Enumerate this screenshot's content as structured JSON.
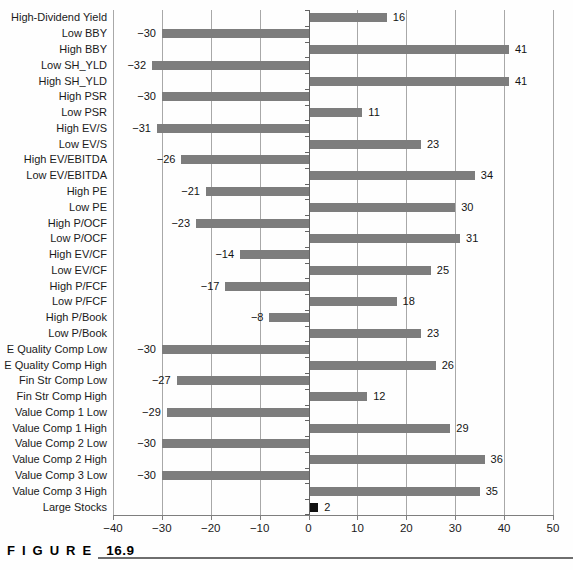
{
  "caption": {
    "figure_word": "FIGURE",
    "figure_number": "16.9"
  },
  "chart_data": {
    "type": "bar",
    "orientation": "horizontal",
    "title": "",
    "xlabel": "",
    "ylabel": "",
    "xlim": [
      -40,
      50
    ],
    "xticks": [
      -40,
      -30,
      -20,
      -10,
      0,
      10,
      20,
      30,
      40,
      50
    ],
    "grid": "vertical gridlines every 10 units",
    "legend": "none",
    "categories": [
      "High-Dividend Yield",
      "Low BBY",
      "High BBY",
      "Low SH_YLD",
      "High SH_YLD",
      "High PSR",
      "Low PSR",
      "High EV/S",
      "Low EV/S",
      "High EV/EBITDA",
      "Low EV/EBITDA",
      "High PE",
      "Low PE",
      "High P/OCF",
      "Low P/OCF",
      "High EV/CF",
      "Low EV/CF",
      "High P/FCF",
      "Low P/FCF",
      "High P/Book",
      "Low P/Book",
      "E Quality Comp Low",
      "E Quality Comp High",
      "Fin Str Comp Low",
      "Fin Str Comp High",
      "Value Comp 1 Low",
      "Value Comp 1 High",
      "Value Comp 2 Low",
      "Value Comp 2 High",
      "Value Comp 3 Low",
      "Value Comp 3 High",
      "Large Stocks"
    ],
    "values": [
      16,
      -30,
      41,
      -32,
      41,
      -30,
      11,
      -31,
      23,
      -26,
      34,
      -21,
      30,
      -23,
      31,
      -14,
      25,
      -17,
      18,
      -8,
      23,
      -30,
      26,
      -27,
      12,
      -29,
      29,
      -30,
      36,
      -30,
      35,
      2
    ],
    "data_labels_shown": true,
    "highlight_category": "Large Stocks",
    "colors": {
      "bar": "#7d7d7d",
      "highlight_bar": "#111111",
      "gridline": "#a8a8a8",
      "axis": "#7e7e7e",
      "zero_axis": "#636363",
      "text": "#1a1a1a"
    }
  }
}
